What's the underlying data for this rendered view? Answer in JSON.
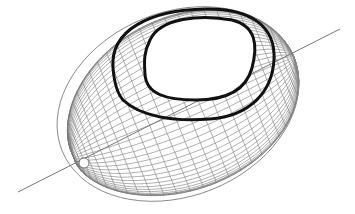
{
  "figure": {
    "width": 355,
    "height": 214,
    "background": "#ffffff",
    "ellipsoid": {
      "center": [
        178,
        104
      ],
      "radii": [
        125,
        92
      ],
      "tilt_deg": -22,
      "pole": [
        84,
        163
      ],
      "pole_hole_radius": 5,
      "mesh_color": "#7a7a7a",
      "meridians": 40,
      "parallels": 30
    },
    "axis": {
      "start": [
        18,
        192
      ],
      "end": [
        340,
        29
      ],
      "color": "#777777"
    },
    "curves": [
      {
        "name": "inner-curve",
        "color": "#111111",
        "width": 3,
        "path": "M 150,40 C 160,18 200,14 232,20 C 256,26 258,45 252,68 C 246,90 226,100 196,100 C 166,100 146,94 145,74 C 144,60 144,52 150,40 Z"
      },
      {
        "name": "outer-curve",
        "color": "#111111",
        "width": 3,
        "path": "M 113,68 C 110,30 150,10 205,9 C 250,8 276,26 274,60 C 272,92 250,116 210,119 C 172,122 140,116 123,100 C 116,92 114,80 113,68 Z"
      }
    ]
  }
}
